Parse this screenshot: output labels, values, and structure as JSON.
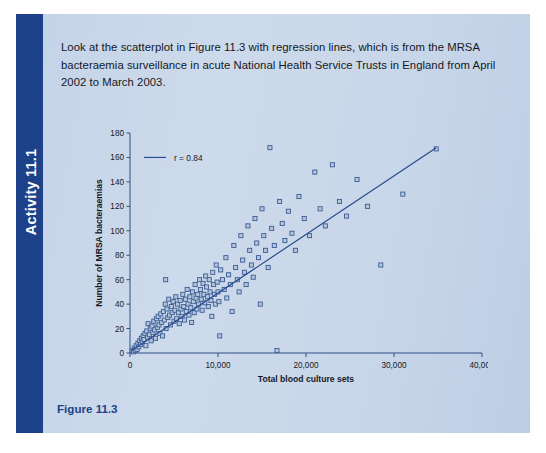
{
  "panel": {
    "sidebar_label": "Activity 11.1",
    "intro_text": "Look at the scatterplot in Figure 11.3 with regression lines, which is from the MRSA bacteraemia surveillance in acute National Health Service Trusts in England from April 2002 to March 2003.",
    "figure_caption": "Figure 11.3",
    "colors": {
      "sidebar": "#1d4289",
      "panel_bg": "#c8d6e9",
      "caption": "#1d4289",
      "marker_fill": "#b4c6de",
      "marker_stroke": "#3c5c92",
      "regression_line": "#24468c"
    }
  },
  "chart_data": {
    "type": "scatter",
    "title": "",
    "xlabel": "Total blood culture sets",
    "ylabel": "Number of MRSA bacteraemias",
    "xlim": [
      0,
      40000
    ],
    "ylim": [
      0,
      180
    ],
    "xticks": [
      0,
      10000,
      20000,
      30000,
      40000
    ],
    "xtick_labels": [
      "0",
      "10,000",
      "20,000",
      "30,000",
      "40,000"
    ],
    "yticks": [
      0,
      20,
      40,
      60,
      80,
      100,
      120,
      140,
      160,
      180
    ],
    "ytick_labels": [
      "0",
      "20",
      "40",
      "60",
      "80",
      "100",
      "120",
      "140",
      "160",
      "180"
    ],
    "grid": false,
    "legend": {
      "position": "top-left-inside",
      "entries": [
        {
          "label": "r = 0.84",
          "marker": "line",
          "color": "#24468c"
        }
      ]
    },
    "annotations": [
      {
        "text": "r = 0.84",
        "kind": "correlation-coefficient",
        "value": 0.84
      }
    ],
    "regression_line": {
      "x": [
        200,
        34800
      ],
      "y": [
        2,
        168
      ],
      "color": "#24468c"
    },
    "points": [
      [
        250,
        2
      ],
      [
        400,
        1
      ],
      [
        500,
        4
      ],
      [
        600,
        2
      ],
      [
        700,
        6
      ],
      [
        800,
        3
      ],
      [
        900,
        8
      ],
      [
        1000,
        5
      ],
      [
        1100,
        10
      ],
      [
        1200,
        7
      ],
      [
        1300,
        12
      ],
      [
        1400,
        9
      ],
      [
        1500,
        14
      ],
      [
        1600,
        11
      ],
      [
        1700,
        16
      ],
      [
        1800,
        6
      ],
      [
        1900,
        18
      ],
      [
        2000,
        13
      ],
      [
        2050,
        24
      ],
      [
        2200,
        15
      ],
      [
        2300,
        20
      ],
      [
        2400,
        10
      ],
      [
        2500,
        22
      ],
      [
        2600,
        17
      ],
      [
        2700,
        26
      ],
      [
        2800,
        19
      ],
      [
        2900,
        12
      ],
      [
        3000,
        28
      ],
      [
        3100,
        21
      ],
      [
        3200,
        30
      ],
      [
        3300,
        23
      ],
      [
        3400,
        16
      ],
      [
        3500,
        32
      ],
      [
        3600,
        25
      ],
      [
        3700,
        14
      ],
      [
        3800,
        34
      ],
      [
        3900,
        27
      ],
      [
        4000,
        40
      ],
      [
        4050,
        60
      ],
      [
        4100,
        20
      ],
      [
        4200,
        36
      ],
      [
        4300,
        29
      ],
      [
        4400,
        44
      ],
      [
        4500,
        31
      ],
      [
        4600,
        23
      ],
      [
        4700,
        38
      ],
      [
        4800,
        33
      ],
      [
        4900,
        42
      ],
      [
        5000,
        26
      ],
      [
        5100,
        35
      ],
      [
        5200,
        46
      ],
      [
        5300,
        28
      ],
      [
        5400,
        40
      ],
      [
        5500,
        33
      ],
      [
        5600,
        24
      ],
      [
        5700,
        43
      ],
      [
        5800,
        36
      ],
      [
        5900,
        30
      ],
      [
        6000,
        48
      ],
      [
        6100,
        38
      ],
      [
        6200,
        27
      ],
      [
        6300,
        44
      ],
      [
        6400,
        34
      ],
      [
        6500,
        52
      ],
      [
        6600,
        40
      ],
      [
        6700,
        31
      ],
      [
        6800,
        46
      ],
      [
        6900,
        37
      ],
      [
        7000,
        25
      ],
      [
        7100,
        50
      ],
      [
        7200,
        42
      ],
      [
        7300,
        33
      ],
      [
        7400,
        56
      ],
      [
        7500,
        45
      ],
      [
        7600,
        36
      ],
      [
        7700,
        48
      ],
      [
        7800,
        40
      ],
      [
        7900,
        60
      ],
      [
        8000,
        52
      ],
      [
        8100,
        44
      ],
      [
        8200,
        35
      ],
      [
        8300,
        57
      ],
      [
        8400,
        48
      ],
      [
        8500,
        41
      ],
      [
        8600,
        63
      ],
      [
        8700,
        54
      ],
      [
        8800,
        46
      ],
      [
        8900,
        38
      ],
      [
        9000,
        60
      ],
      [
        9100,
        50
      ],
      [
        9200,
        43
      ],
      [
        9300,
        30
      ],
      [
        9400,
        66
      ],
      [
        9500,
        56
      ],
      [
        9600,
        48
      ],
      [
        9700,
        40
      ],
      [
        9800,
        72
      ],
      [
        9900,
        58
      ],
      [
        10000,
        50
      ],
      [
        10100,
        42
      ],
      [
        10200,
        14
      ],
      [
        10300,
        68
      ],
      [
        10500,
        60
      ],
      [
        10700,
        52
      ],
      [
        10900,
        78
      ],
      [
        11000,
        45
      ],
      [
        11200,
        64
      ],
      [
        11400,
        56
      ],
      [
        11600,
        34
      ],
      [
        11800,
        88
      ],
      [
        12000,
        70
      ],
      [
        12200,
        60
      ],
      [
        12400,
        50
      ],
      [
        12600,
        96
      ],
      [
        12800,
        76
      ],
      [
        13000,
        66
      ],
      [
        13200,
        56
      ],
      [
        13400,
        104
      ],
      [
        13600,
        84
      ],
      [
        13800,
        72
      ],
      [
        14000,
        62
      ],
      [
        14200,
        110
      ],
      [
        14400,
        90
      ],
      [
        14600,
        78
      ],
      [
        14800,
        40
      ],
      [
        15000,
        118
      ],
      [
        15200,
        96
      ],
      [
        15400,
        84
      ],
      [
        15700,
        70
      ],
      [
        15900,
        168
      ],
      [
        16100,
        102
      ],
      [
        16400,
        88
      ],
      [
        16700,
        2
      ],
      [
        17000,
        124
      ],
      [
        17300,
        106
      ],
      [
        17600,
        92
      ],
      [
        18000,
        116
      ],
      [
        18400,
        98
      ],
      [
        18800,
        84
      ],
      [
        19200,
        128
      ],
      [
        19800,
        110
      ],
      [
        20400,
        96
      ],
      [
        21000,
        148
      ],
      [
        21600,
        118
      ],
      [
        22200,
        104
      ],
      [
        23000,
        154
      ],
      [
        23800,
        124
      ],
      [
        24600,
        112
      ],
      [
        25800,
        142
      ],
      [
        27000,
        120
      ],
      [
        28500,
        72
      ],
      [
        31000,
        130
      ],
      [
        34800,
        167
      ]
    ]
  }
}
